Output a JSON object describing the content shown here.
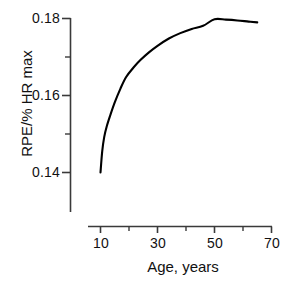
{
  "chart_data": {
    "type": "line",
    "title": "",
    "subtitle": "",
    "xlabel": "Age,  years",
    "ylabel": "RPE/% HR max",
    "xlim": [
      5,
      70
    ],
    "ylim": [
      0.131,
      0.181
    ],
    "grid": false,
    "legend": null,
    "line_color": "#000000",
    "axis_color": "#3a3a3a",
    "x_major_ticks": [
      10,
      30,
      50,
      70
    ],
    "x_minor_ticks": [
      20,
      40,
      60
    ],
    "x_tick_labels": [
      "10",
      "30",
      "50",
      "70"
    ],
    "y_major_ticks": [
      0.14,
      0.16,
      0.18
    ],
    "y_minor_ticks": [
      0.15,
      0.17
    ],
    "y_tick_labels": [
      "0.14",
      "0.16",
      "0.18"
    ],
    "series": [
      {
        "name": "RPE/%HRmax vs Age",
        "x": [
          10,
          10.6,
          11.3,
          12.2,
          13.4,
          15,
          17,
          19,
          21.5,
          24,
          27,
          30,
          34,
          38,
          42,
          46,
          50,
          54,
          58,
          62,
          65
        ],
        "y": [
          0.14,
          0.1455,
          0.1492,
          0.152,
          0.1548,
          0.1582,
          0.1618,
          0.1648,
          0.1672,
          0.1692,
          0.1712,
          0.1729,
          0.1748,
          0.1762,
          0.1773,
          0.1781,
          0.1798,
          0.1797,
          0.1795,
          0.1792,
          0.179
        ]
      }
    ],
    "annotations": []
  },
  "figure": {
    "background": "#ffffff",
    "x_axis_title": "Age,  years",
    "y_axis_title": "RPE/% HR max",
    "y_tick_labels": [
      "0.18",
      "0.16",
      "0.14"
    ],
    "x_tick_labels": [
      "10",
      "30",
      "50",
      "70"
    ]
  }
}
